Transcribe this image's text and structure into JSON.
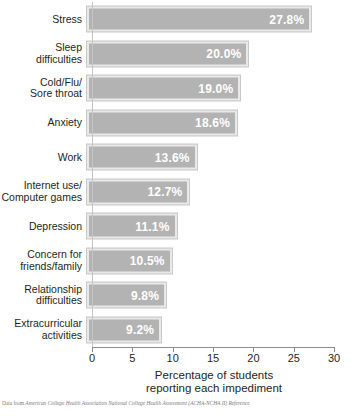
{
  "chart_data": {
    "type": "bar",
    "orientation": "horizontal",
    "title": "",
    "xlabel": "Percentage of students\nreporting  each impediment",
    "ylabel": "",
    "xlim": [
      0,
      30
    ],
    "xticks": [
      0,
      5,
      10,
      15,
      20,
      25,
      30
    ],
    "xtick_labels": [
      "0",
      "5",
      "10",
      "15",
      "20",
      "25",
      "30"
    ],
    "grid": false,
    "legend": null,
    "categories": [
      "Stress",
      "Sleep\ndifficulties",
      "Cold/Flu/\nSore throat",
      "Anxiety",
      "Work",
      "Internet use/\nComputer games",
      "Depression",
      "Concern for\nfriends/family",
      "Relationship\ndifficulties",
      "Extracurricular\nactivities"
    ],
    "values": [
      27.8,
      20.0,
      19.0,
      18.6,
      13.6,
      12.7,
      11.1,
      10.5,
      9.8,
      9.2
    ],
    "value_labels": [
      "27.8%",
      "20.0%",
      "19.0%",
      "18.6%",
      "13.6%",
      "12.7%",
      "11.1%",
      "10.5%",
      "9.8%",
      "9.2%"
    ],
    "bar_color": "#b3b3b3",
    "bar_border_color": "#e9e9e9",
    "value_label_color": "#ffffff",
    "axis_color": "#8d8d8d",
    "text_color": "#231f20"
  },
  "caption": {
    "prefix": "Data from ",
    "source": "American College Health Association National College Health Assessment (ACHA-NCHA II) Reference"
  }
}
